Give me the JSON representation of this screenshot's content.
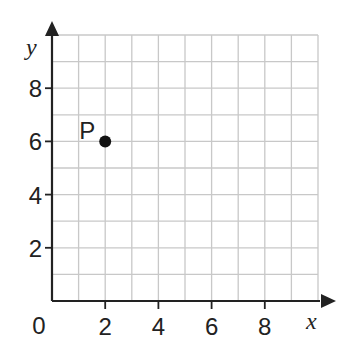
{
  "chart_data": {
    "type": "scatter",
    "title": "",
    "xlabel": "x",
    "ylabel": "y",
    "xlim": [
      0,
      10
    ],
    "ylim": [
      0,
      10
    ],
    "grid": true,
    "grid_step": 1,
    "x_ticks": [
      2,
      4,
      6,
      8
    ],
    "y_ticks": [
      2,
      4,
      6,
      8
    ],
    "origin_label": "0",
    "points": [
      {
        "label": "P",
        "x": 2,
        "y": 6
      }
    ],
    "colors": {
      "grid": "#c8c8c8",
      "axis": "#222222",
      "point": "#111111"
    }
  }
}
